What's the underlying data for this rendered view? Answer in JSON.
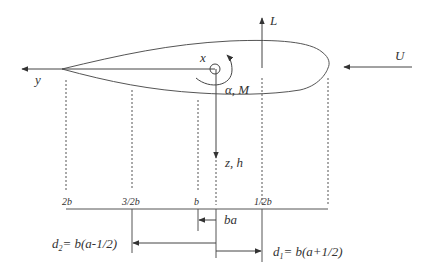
{
  "axes": {
    "x_label": "x",
    "y_label": "y",
    "z_label": "z, h",
    "lift_label": "L",
    "freestream_label": "U",
    "pitch_label": "α, M"
  },
  "stations": [
    {
      "label": "2b"
    },
    {
      "label": "3/2b"
    },
    {
      "label": "b"
    },
    {
      "label": "1/2b"
    }
  ],
  "dimensions": {
    "ba": "ba",
    "d2_lhs": "d",
    "d2_sub": "2",
    "d2_rhs": "= b(a-1/2)",
    "d1_lhs": "d",
    "d1_sub": "1",
    "d1_rhs": "= b(a+1/2)"
  },
  "colors": {
    "line": "#444444",
    "text": "#333333"
  }
}
